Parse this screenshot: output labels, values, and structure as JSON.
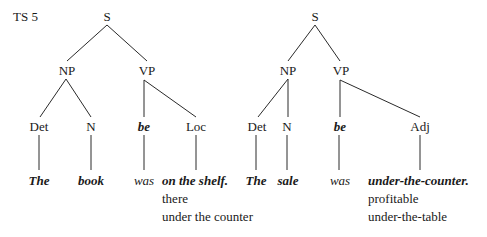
{
  "label": "TS 5",
  "trees": [
    {
      "root": "S",
      "np": "NP",
      "vp": "VP",
      "categories": {
        "det": "Det",
        "n": "N",
        "be": "be",
        "pred": "Loc"
      },
      "words": {
        "det": "The",
        "n": "book",
        "be": "was",
        "pred": "on the shelf."
      },
      "alternatives": [
        "there",
        "under the counter"
      ]
    },
    {
      "root": "S",
      "np": "NP",
      "vp": "VP",
      "categories": {
        "det": "Det",
        "n": "N",
        "be": "be",
        "pred": "Adj"
      },
      "words": {
        "det": "The",
        "n": "sale",
        "be": "was",
        "pred": "under-the-counter."
      },
      "alternatives": [
        "profitable",
        "under-the-table"
      ]
    }
  ]
}
